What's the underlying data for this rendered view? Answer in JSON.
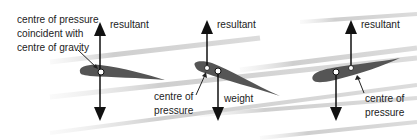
{
  "diagram": {
    "panels": [
      {
        "id": "left",
        "labels": {
          "cp_cg": [
            "centre of pressure",
            "coincident with",
            "centre of gravity"
          ],
          "resultant": "resultant"
        }
      },
      {
        "id": "middle",
        "labels": {
          "resultant": "resultant",
          "cp": [
            "centre of",
            "pressure"
          ],
          "weight": "weight"
        }
      },
      {
        "id": "right",
        "labels": {
          "resultant": "resultant",
          "cp": [
            "centre of",
            "pressure"
          ]
        }
      }
    ],
    "colors": {
      "airfoil": "#555555",
      "arrow": "#111111",
      "airflow": "#d9d9d9"
    }
  }
}
